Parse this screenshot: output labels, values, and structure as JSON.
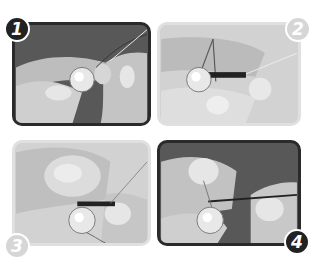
{
  "figure": {
    "type": "step-by-step illustration",
    "panels": [
      {
        "step": "1",
        "background": "dark",
        "description": "Hands holding a bead with thread looped around fingers"
      },
      {
        "step": "2",
        "background": "light",
        "description": "Thread pulled through bead hole with needle"
      },
      {
        "step": "3",
        "background": "light",
        "description": "Thumb pressing thread beside bead while needle passes through"
      },
      {
        "step": "4",
        "background": "dark",
        "description": "Needle drawn through loop above bead to tighten knot"
      }
    ],
    "colors": {
      "dark_panel": "#585858",
      "light_panel": "#d2d2d2",
      "badge_dark": "#222222",
      "badge_light": "#d6d6d6",
      "bead": "#e8e8e8"
    }
  }
}
